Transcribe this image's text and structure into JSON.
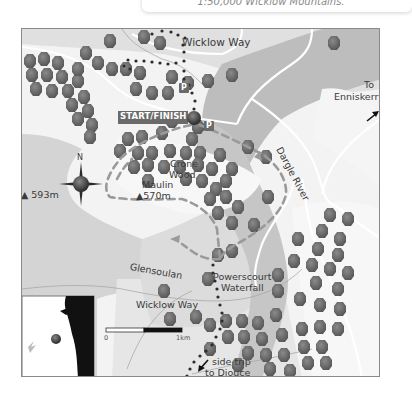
{
  "caption": {
    "text": "1:50,000 Wicklow Mountains."
  },
  "map": {
    "labels": {
      "wicklow_way_top": "Wicklow Way",
      "wicklow_way_bottom": "Wicklow Way",
      "to": "To",
      "enniskerry": "Enniskerry",
      "dargle_river": "Dargle River",
      "start_finish": "START/FINISH",
      "north": "N",
      "crone": "Crone",
      "wood": "Wood",
      "maulin": "Maulin",
      "maulin_height": "▲570m",
      "peak_593": "▲ 593m",
      "glensoulan": "Glensoulan",
      "powerscourt": "Powerscourt",
      "waterfall": "Waterfall",
      "side_trip": "side trip",
      "to_djouce": "to Djouce",
      "parking": "P",
      "scale_zero": "0",
      "scale_one": "1km"
    },
    "colors": {
      "background": "#f3f3f3",
      "land_light": "#e3e3e3",
      "land_mid": "#cfcfcf",
      "river_valley": "#b9b9b9",
      "tree": "#6b6b6b",
      "trail_dashed": "#9a9a9a",
      "wicklow_way_dots": "#2b2b2b",
      "label_box": "#6a6a6a"
    }
  }
}
